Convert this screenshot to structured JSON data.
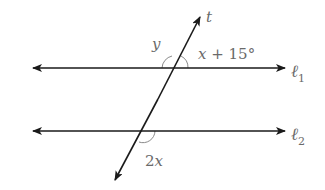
{
  "diagram": {
    "type": "parallel-lines-transversal",
    "colors": {
      "line": "#1a1a1a",
      "label": "#6a6a6a",
      "arc": "#8a8a8a"
    },
    "lines": [
      {
        "id": "l1",
        "label_base": "ℓ",
        "label_sub": "1",
        "y": 68,
        "x1": 33,
        "x2": 285
      },
      {
        "id": "l2",
        "label_base": "ℓ",
        "label_sub": "2",
        "y": 131,
        "x1": 33,
        "x2": 285
      }
    ],
    "transversal": {
      "label": "t",
      "top": [
        200,
        17
      ],
      "bottom": [
        115,
        180
      ]
    },
    "angles": [
      {
        "id": "angle-y",
        "label": "y",
        "at_line": "l1",
        "position": "upper-left"
      },
      {
        "id": "angle-x-plus-15",
        "label_var": "x",
        "label_rest": " + 15°",
        "at_line": "l1",
        "position": "upper-right"
      },
      {
        "id": "angle-2x",
        "label_num": "2",
        "label_var": "x",
        "at_line": "l2",
        "position": "lower-right"
      }
    ]
  }
}
